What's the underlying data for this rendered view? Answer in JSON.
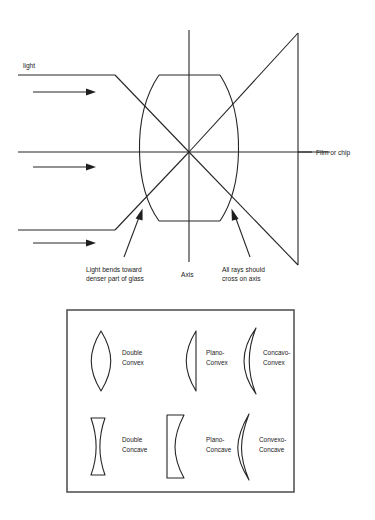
{
  "figure": {
    "type": "optics-diagram",
    "title_text": null,
    "background": "#ffffff",
    "ink_color": "#262626",
    "upper_diagram": {
      "name": "lens-ray-diagram",
      "labels": {
        "light": "light",
        "film_or_chip": "Film or chip",
        "axis": "Axis",
        "bend_note_line1": "Light bends toward",
        "bend_note_line2": "denser part of glass",
        "cross_note_line1": "All rays should",
        "cross_note_line2": "cross on axis"
      },
      "elements": {
        "incoming_rays": 3,
        "lens_shape": "double-convex",
        "optical_axis_y": 152,
        "lens_center_x": 189,
        "focal_plane_x": 298
      }
    },
    "lens_types_panel": {
      "name": "lens-types-panel",
      "rows": [
        {
          "row": 1,
          "items": [
            {
              "shape": "double-convex",
              "label_line1": "Double",
              "label_line2": "Convex"
            },
            {
              "shape": "plano-convex",
              "label_line1": "Plano-",
              "label_line2": "Convex"
            },
            {
              "shape": "concavo-convex",
              "label_line1": "Concavo-",
              "label_line2": "Convex"
            }
          ]
        },
        {
          "row": 2,
          "items": [
            {
              "shape": "double-concave",
              "label_line1": "Double",
              "label_line2": "Concave"
            },
            {
              "shape": "plano-concave",
              "label_line1": "Plano-",
              "label_line2": "Concave"
            },
            {
              "shape": "convexo-concave",
              "label_line1": "Convexo-",
              "label_line2": "Concave"
            }
          ]
        }
      ]
    }
  }
}
